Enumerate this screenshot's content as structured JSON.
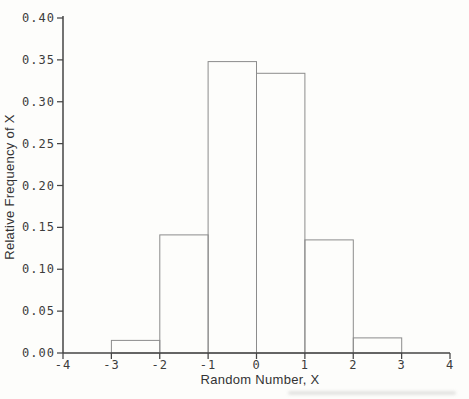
{
  "chart_data": {
    "type": "bar",
    "subtype": "histogram",
    "title": "",
    "xlabel": "Random Number, X",
    "ylabel": "Relative Frequency of X",
    "xlim": [
      -4,
      4
    ],
    "ylim": [
      0,
      0.4
    ],
    "grid": false,
    "legend": null,
    "x_tick_values": [
      -4,
      -3,
      -2,
      -1,
      0,
      1,
      2,
      3,
      4
    ],
    "x_tick_labels": [
      "-4",
      "-3",
      "-2",
      "-1",
      "0",
      "1",
      "2",
      "3",
      "4"
    ],
    "y_tick_values": [
      0.0,
      0.05,
      0.1,
      0.15,
      0.2,
      0.25,
      0.3,
      0.35,
      0.4
    ],
    "y_tick_labels": [
      "0.00",
      "0.05",
      "0.10",
      "0.15",
      "0.20",
      "0.25",
      "0.30",
      "0.35",
      "0.40"
    ],
    "bins": [
      {
        "x0": -3,
        "x1": -2,
        "value": 0.015
      },
      {
        "x0": -2,
        "x1": -1,
        "value": 0.141
      },
      {
        "x0": -1,
        "x1": 0,
        "value": 0.348
      },
      {
        "x0": 0,
        "x1": 1,
        "value": 0.334
      },
      {
        "x0": 1,
        "x1": 2,
        "value": 0.135
      },
      {
        "x0": 2,
        "x1": 3,
        "value": 0.018
      }
    ],
    "colors": {
      "axis": "#454545",
      "tick_label": "#3c3c3c",
      "axis_title": "#333333",
      "bar_outline": "#8c8c8c",
      "background": "#fdfdfb"
    }
  }
}
